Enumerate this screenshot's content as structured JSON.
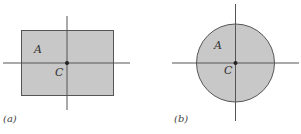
{
  "figure": {
    "panels": [
      {
        "id": "a",
        "caption": "(a)",
        "shape": "rectangle",
        "area_label": "A",
        "centroid_label": "C",
        "fill": "#c8c8c8",
        "stroke": "#555555"
      },
      {
        "id": "b",
        "caption": "(b)",
        "shape": "circle",
        "area_label": "A",
        "centroid_label": "C",
        "fill": "#c8c8c8",
        "stroke": "#555555"
      }
    ],
    "axis_color": "#555555",
    "centroid_dot_color": "#222222"
  }
}
